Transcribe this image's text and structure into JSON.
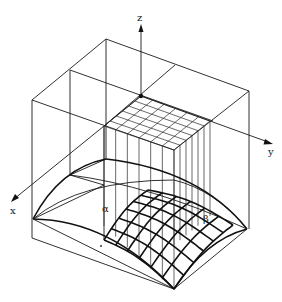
{
  "figure": {
    "type": "3D shell surface over rectangular plan with coordinate system",
    "axes": {
      "x_label": "x",
      "y_label": "y",
      "z_label": "z"
    },
    "surface_parameters": {
      "alpha_label": "α",
      "beta_label": "β"
    },
    "mesh": {
      "plan_grid_divisions": 6,
      "surface_grid_divisions": 6
    },
    "colors": {
      "line": "#1a1a1a",
      "background": "#ffffff"
    }
  }
}
